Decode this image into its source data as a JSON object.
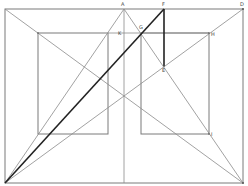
{
  "diagram": {
    "type": "geometric perspective construction",
    "labels": {
      "A": "A",
      "F": "F",
      "D": "D",
      "K": "K",
      "G": "G",
      "H": "H",
      "E": "E",
      "I": "I"
    },
    "points": {
      "A": [
        124,
        9
      ],
      "F": [
        164,
        9
      ],
      "D": [
        243,
        9
      ],
      "K": [
        118,
        33
      ],
      "G": [
        141,
        33
      ],
      "H": [
        209,
        33
      ],
      "E": [
        164,
        66
      ],
      "I": [
        209,
        134
      ],
      "BL": [
        5,
        183
      ],
      "BR": [
        243,
        183
      ],
      "TL": [
        5,
        9
      ]
    },
    "colors": {
      "thin_line": "#8a8a8a",
      "bold_line": "#222222",
      "background": "#ffffff"
    }
  }
}
